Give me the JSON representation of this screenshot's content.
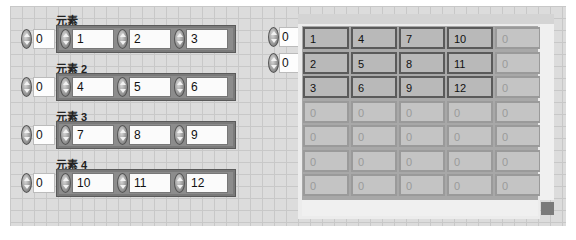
{
  "cluster_array": {
    "index_value": "0",
    "elements": [
      {
        "label": "元素",
        "index": "0",
        "values": [
          "1",
          "2",
          "3"
        ]
      },
      {
        "label": "元素 2",
        "index": "0",
        "values": [
          "4",
          "5",
          "6"
        ]
      },
      {
        "label": "元素 3",
        "index": "0",
        "values": [
          "7",
          "8",
          "9"
        ]
      },
      {
        "label": "元素 4",
        "index": "0",
        "values": [
          "10",
          "11",
          "12"
        ]
      }
    ]
  },
  "array_2d": {
    "row_index": "0",
    "col_index": "0",
    "rows": [
      [
        "1",
        "4",
        "7",
        "10",
        "0"
      ],
      [
        "2",
        "5",
        "8",
        "11",
        "0"
      ],
      [
        "3",
        "6",
        "9",
        "12",
        "0"
      ],
      [
        "0",
        "0",
        "0",
        "0",
        "0"
      ],
      [
        "0",
        "0",
        "0",
        "0",
        "0"
      ],
      [
        "0",
        "0",
        "0",
        "0",
        "0"
      ],
      [
        "0",
        "0",
        "0",
        "0",
        "0"
      ]
    ],
    "active_rows": 3,
    "active_cols": 4
  }
}
